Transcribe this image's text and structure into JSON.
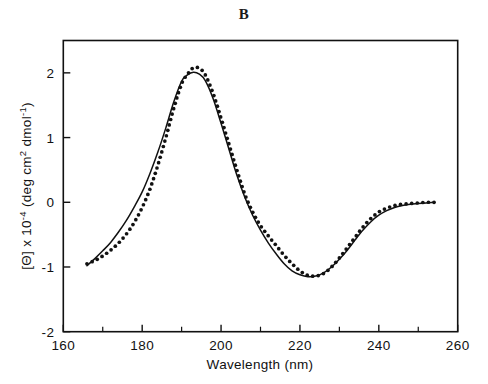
{
  "figure": {
    "panel_label": "B",
    "background_color": "#ffffff",
    "ink_color": "#111111"
  },
  "chart_data": {
    "type": "line",
    "title": "B",
    "xlabel": "Wavelength (nm)",
    "ylabel": "[Θ] x 10⁻⁴ (deg cm² dmol⁻¹)",
    "ylabel_parts": {
      "theta_bracket": "[Θ] x 10",
      "exponent": "-4",
      "units_open": " (deg cm",
      "units_sup": "2",
      "units_mid": " dmol",
      "units_sup2": "-1",
      "units_close": ")"
    },
    "xlim": [
      160,
      260
    ],
    "ylim": [
      -2,
      2.5
    ],
    "xticks": [
      160,
      180,
      200,
      220,
      240,
      260
    ],
    "xtick_labels": [
      "160",
      "180",
      "200",
      "220",
      "240",
      "260"
    ],
    "xticks_minor": [
      170,
      190,
      210,
      230,
      250
    ],
    "yticks": [
      2,
      1,
      0,
      -1,
      -2
    ],
    "ytick_labels": [
      "2",
      "1",
      "0",
      "-1",
      "-2"
    ],
    "grid": false,
    "legend": null,
    "legend_position": "none",
    "frame": "left-bottom-right-top",
    "series": [
      {
        "name": "calculated",
        "style": "solid-line",
        "color": "#111111",
        "x": [
          166,
          168,
          170,
          172,
          174,
          176,
          178,
          180,
          182,
          184,
          186,
          188,
          190,
          191.5,
          193,
          194.5,
          196,
          198,
          200,
          202,
          204,
          206,
          208,
          210,
          212,
          214,
          216,
          218,
          220,
          222,
          224,
          226,
          228,
          230,
          232,
          234,
          236,
          238,
          240,
          242,
          244,
          246,
          248,
          250,
          252,
          254
        ],
        "y": [
          -0.98,
          -0.87,
          -0.75,
          -0.62,
          -0.46,
          -0.28,
          -0.07,
          0.16,
          0.45,
          0.78,
          1.15,
          1.55,
          1.87,
          1.97,
          2.01,
          1.98,
          1.88,
          1.6,
          1.22,
          0.82,
          0.42,
          0.08,
          -0.2,
          -0.43,
          -0.63,
          -0.8,
          -0.95,
          -1.06,
          -1.12,
          -1.15,
          -1.14,
          -1.09,
          -1.0,
          -0.88,
          -0.74,
          -0.58,
          -0.43,
          -0.3,
          -0.2,
          -0.13,
          -0.08,
          -0.05,
          -0.03,
          -0.02,
          -0.01,
          0.0
        ]
      },
      {
        "name": "experimental",
        "style": "dotted-markers",
        "color": "#111111",
        "x": [
          166,
          168,
          170,
          172,
          174,
          176,
          178,
          180,
          182,
          184,
          186,
          188,
          190,
          191.5,
          193,
          194.5,
          196,
          198,
          200,
          202,
          204,
          206,
          208,
          210,
          212,
          214,
          216,
          218,
          220,
          222,
          224,
          226,
          228,
          230,
          232,
          234,
          236,
          238,
          240,
          242,
          244,
          246,
          248,
          250,
          252,
          254
        ],
        "y": [
          -0.95,
          -0.9,
          -0.83,
          -0.74,
          -0.63,
          -0.49,
          -0.31,
          -0.08,
          0.21,
          0.58,
          1.0,
          1.45,
          1.83,
          1.98,
          2.08,
          2.07,
          1.97,
          1.68,
          1.3,
          0.9,
          0.5,
          0.13,
          -0.15,
          -0.36,
          -0.52,
          -0.67,
          -0.82,
          -0.95,
          -1.06,
          -1.13,
          -1.14,
          -1.1,
          -1.0,
          -0.86,
          -0.7,
          -0.54,
          -0.38,
          -0.25,
          -0.15,
          -0.09,
          -0.05,
          -0.03,
          -0.02,
          -0.01,
          0.0,
          0.0
        ]
      }
    ]
  }
}
